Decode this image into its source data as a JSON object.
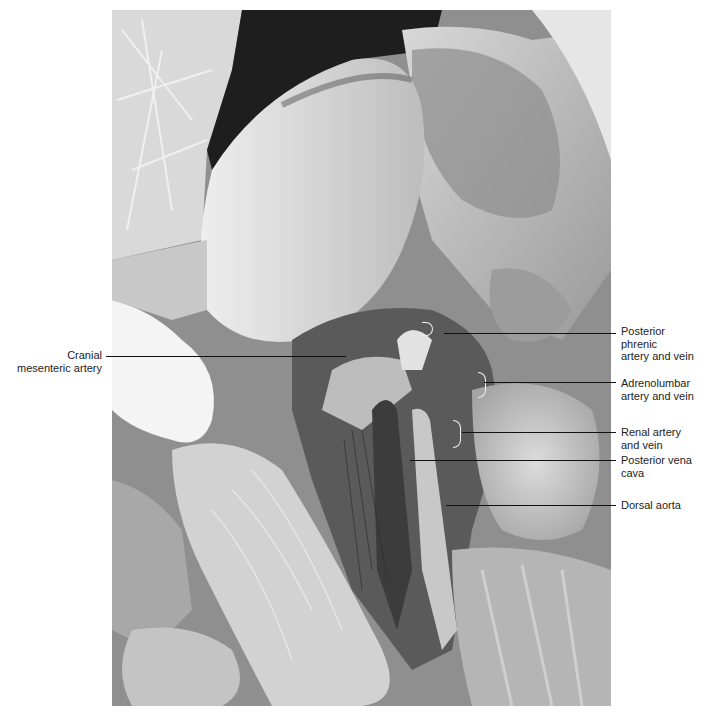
{
  "figure": {
    "labels": {
      "cranial_mesenteric": {
        "line1": "Cranial",
        "line2": "mesenteric artery"
      },
      "posterior_phrenic": {
        "line1": "Posterior",
        "line2": "phrenic",
        "line3": "artery and vein"
      },
      "adrenolumbar": {
        "line1": "Adrenolumbar",
        "line2": "artery and vein"
      },
      "renal": {
        "line1": "Renal artery",
        "line2": "and vein"
      },
      "posterior_vena_cava": {
        "line1": "Posterior vena",
        "line2": "cava"
      },
      "dorsal_aorta": {
        "line1": "Dorsal aorta"
      }
    }
  }
}
